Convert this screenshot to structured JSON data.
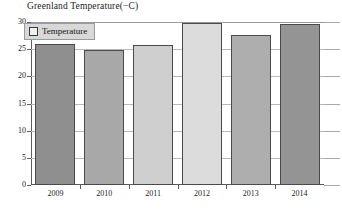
{
  "chart_data": {
    "type": "bar",
    "title": "Greenland Temperature(−C)",
    "xlabel": "",
    "ylabel": "",
    "categories": [
      "2009",
      "2010",
      "2011",
      "2012",
      "2013",
      "2014"
    ],
    "values": [
      26.0,
      24.8,
      25.7,
      29.9,
      27.6,
      29.6
    ],
    "series": [
      {
        "name": "Temperature",
        "values": [
          26.0,
          24.8,
          25.7,
          29.9,
          27.6,
          29.6
        ]
      }
    ],
    "ylim": [
      0,
      30
    ],
    "yticks": [
      0,
      5,
      10,
      15,
      20,
      25,
      30
    ],
    "ytick_labels": [
      "0",
      "5",
      "10",
      "15",
      "20",
      "25",
      "30"
    ],
    "grid": true,
    "legend": {
      "position": "top-left",
      "entries": [
        {
          "label": "Temperature",
          "swatch_color": "#efefef"
        }
      ]
    },
    "bar_colors": [
      "#8f8f8f",
      "#a8a8a8",
      "#cfcfcf",
      "#dcdcdc",
      "#aeaeae",
      "#949494"
    ]
  },
  "colors": {
    "axis": "#5d5d5d",
    "gridline": "#b9b9b9",
    "text": "#1c1c1c",
    "legend_background": "#d8d8d8",
    "legend_border": "#9a9a9a",
    "bar_border": "#4a4a4a",
    "background": "#ffffff"
  }
}
